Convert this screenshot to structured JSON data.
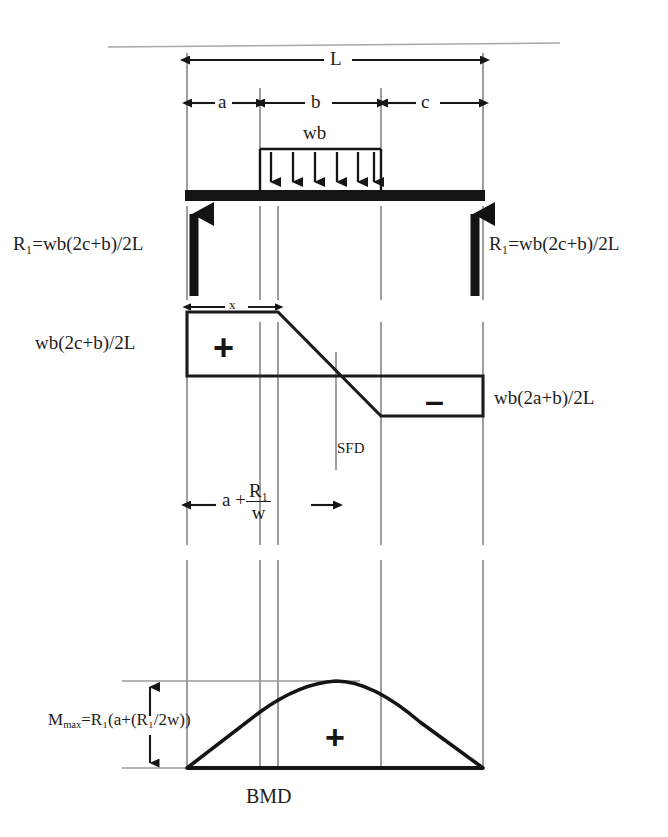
{
  "figure": {
    "title_caption": "BMD",
    "sfd_caption": "SFD"
  },
  "beam": {
    "span_label": "L",
    "segment_a_label": "a",
    "segment_b_label": "b",
    "segment_c_label": "c",
    "load_label": "wb",
    "load_arrow_count": 6,
    "reaction_left": "R₁=wb(2c+b)/2L",
    "reaction_right": "R₁=wb(2c+b)/2L"
  },
  "sfd": {
    "caption": "SFD",
    "x_dimension_label": "x",
    "positive_sign": "+",
    "negative_sign": "–",
    "left_ordinate_label": "wb(2c+b)/2L",
    "right_ordinate_label": "wb(2a+b)/2L"
  },
  "bmd": {
    "caption": "BMD",
    "positive_sign": "+",
    "max_moment_label": "Mₘₐₓ=R₁(a+(R₁/2w))",
    "max_moment_parts": {
      "symbol": "M",
      "subscript": "max",
      "equals_expression": "=R₁(a+(R₁/2w))"
    },
    "dimension_label_parts": {
      "prefix": "a +",
      "numerator": "R₁",
      "denominator": "w"
    },
    "dimension_label_plain": "a + R₁/w"
  },
  "geometry": {
    "left_support_x": 187,
    "right_support_x": 483,
    "load_start_x": 260,
    "load_end_x": 381,
    "zero_shear_x": 336,
    "beam_y": 196,
    "sfd_top_y": 312,
    "sfd_zero_y": 376,
    "sfd_bottom_y": 416,
    "bmd_base_y": 768,
    "bmd_peak_y": 681,
    "bmd_peak_x": 336
  },
  "colors": {
    "ink": "#1a1a1a",
    "beam_fill": "#151515",
    "gridline": "#8a8a8a",
    "rule": "#9c9c9c"
  }
}
